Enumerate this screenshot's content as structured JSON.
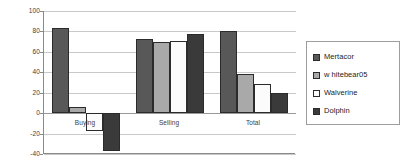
{
  "chart_data": {
    "type": "bar",
    "title": "",
    "xlabel": "",
    "ylabel": "",
    "categories": [
      "Buying",
      "Selling",
      "Total"
    ],
    "series": [
      {
        "name": "Mertacor",
        "color": "#585858",
        "values": [
          83,
          73,
          80
        ]
      },
      {
        "name": "w hitebear05",
        "color": "#a9a9a9",
        "values": [
          6,
          70,
          38
        ]
      },
      {
        "name": "Walverine",
        "color": "#fbfbfb",
        "values": [
          -17,
          71,
          29
        ]
      },
      {
        "name": "Dolphin",
        "color": "#3a3a3a",
        "values": [
          -37,
          77,
          20
        ]
      }
    ],
    "ylim": [
      -40,
      100
    ],
    "yticks": [
      100,
      80,
      60,
      40,
      20,
      0,
      -20,
      -40
    ],
    "ytick_labels": [
      "100",
      "80",
      "60",
      "40",
      "20",
      "0",
      "-20",
      "-40"
    ],
    "grid": true,
    "legend_position": "right",
    "legend_entries": [
      "Mertacor",
      "w hitebear05",
      "Walverine",
      "Dolphin"
    ]
  }
}
